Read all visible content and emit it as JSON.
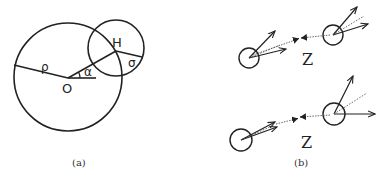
{
  "panel_a": {
    "caption": "(a)",
    "labels": {
      "center_big": "O",
      "center_small": "H",
      "radius_big": "ρ",
      "angle": "α",
      "radius_small": "σ"
    }
  },
  "panel_b": {
    "caption": "(b)",
    "top": {
      "label": "Z"
    },
    "bottom": {
      "label": "Z"
    }
  },
  "colors": {
    "stroke": "#222222",
    "background": "#ffffff"
  }
}
